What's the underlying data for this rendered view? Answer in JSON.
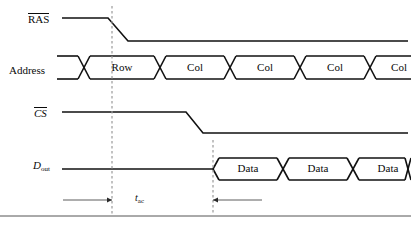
{
  "figure": {
    "kind": "timing-diagram",
    "background_color": "#ffffff",
    "line_color": "#111111",
    "dashed_color": "#9a9a9a",
    "width": 411,
    "height": 231
  },
  "signals": [
    {
      "id": "ras",
      "label_text": "RAS",
      "label_style": "overline",
      "label_x": 28,
      "label_y": 13,
      "type": "level",
      "high_y": 18,
      "low_y": 41,
      "start_x": 62,
      "end_x": 408,
      "fall_start_x": 108,
      "fall_end_x": 128
    },
    {
      "id": "address",
      "label_text": "Address",
      "label_style": "plain",
      "label_x": 9,
      "label_y": 65,
      "type": "bus",
      "top_y": 56,
      "bottom_y": 79,
      "start_x": 57,
      "end_x": 411,
      "cross_width": 12,
      "segments": [
        {
          "text": "Row",
          "cross_center_x": 84,
          "text_center_x": 122
        },
        {
          "text": "Col",
          "cross_center_x": 160,
          "text_center_x": 195
        },
        {
          "text": "Col",
          "cross_center_x": 230,
          "text_center_x": 265
        },
        {
          "text": "Col",
          "cross_center_x": 300,
          "text_center_x": 335
        },
        {
          "text": "Col",
          "cross_center_x": 370,
          "text_center_x": 399
        }
      ]
    },
    {
      "id": "cs",
      "label_text": "CS",
      "label_style": "overline-italic",
      "label_x": 34,
      "label_y": 107,
      "type": "level",
      "high_y": 112,
      "low_y": 133,
      "start_x": 62,
      "end_x": 408,
      "fall_start_x": 186,
      "fall_end_x": 203
    },
    {
      "id": "dout",
      "label_text": "D",
      "label_sub": "out",
      "label_style": "italic-sub",
      "label_x": 33,
      "label_y": 160,
      "type": "bus-from-idle",
      "idle_y": 169,
      "top_y": 158,
      "bottom_y": 180,
      "start_x": 62,
      "open_x": 213,
      "end_x": 411,
      "cross_width": 12,
      "segments": [
        {
          "text": "Data",
          "cross_center_x": 283,
          "text_center_x": 248
        },
        {
          "text": "Data",
          "cross_center_x": 353,
          "text_center_x": 318
        },
        {
          "text": "Data",
          "cross_center_x": 411,
          "text_center_x": 388
        }
      ]
    }
  ],
  "reference_lines": [
    {
      "id": "ref-ras-edge",
      "x": 112,
      "y_top": 6,
      "y_bottom": 215
    },
    {
      "id": "ref-data-edge",
      "x": 213,
      "y_top": 140,
      "y_bottom": 215
    }
  ],
  "annotations": {
    "timing_measure": {
      "symbol": "t",
      "subscript": "ac",
      "label_x": 135,
      "label_y": 192,
      "arrow_y": 200,
      "left_arrow": {
        "tail_x": 63,
        "head_x": 112
      },
      "right_arrow": {
        "tail_x": 262,
        "head_x": 213
      }
    }
  },
  "footer_rule": {
    "y": 216,
    "x_start": 0,
    "x_end": 411
  }
}
